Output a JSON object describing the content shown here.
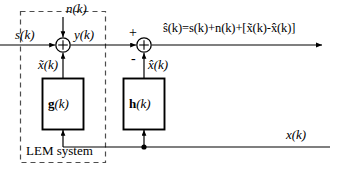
{
  "diagram": {
    "background_color": "#ffffff",
    "line_color": "#000000",
    "dashed_box_color": "#555555"
  },
  "system_box": {
    "label": "LEM system",
    "style": "dashed"
  },
  "blocks": [
    {
      "id": "g",
      "label": "g(k)",
      "label_bold_part": "g",
      "label_arg": "(k)"
    },
    {
      "id": "h",
      "label": "h(k)",
      "label_bold_part": "h",
      "label_arg": "(k)"
    }
  ],
  "signals": {
    "input_s": "s(k)",
    "noise_n": "n(k)",
    "sum_output_y": "y(k)",
    "echo_tilde_x": "x̃(k)",
    "echo_estimate_hat_x": "x̂(k)",
    "far_end_x": "x(k)",
    "output_equation": "ŝ(k)=s(k)+n(k)+[x̃(k)-x̂(k)]"
  },
  "signs": {
    "plus": "+",
    "minus": "-"
  },
  "summing_junctions": [
    {
      "id": "sum1",
      "symbol": "⊕"
    },
    {
      "id": "sum2",
      "symbol": "⊕"
    }
  ]
}
